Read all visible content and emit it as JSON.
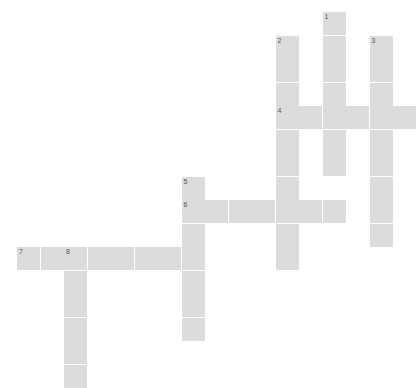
{
  "puzzle": {
    "title": "Crossword Puzzle Grid",
    "type": "crossword-grid",
    "columns": 17,
    "rows": 15,
    "cell_size_px": 23,
    "cell_pitch_px": 23.5,
    "origin_x_px": 17,
    "origin_y_px": 12,
    "cell_color": "#dcdcdc",
    "background_color": "#ffffff",
    "number_color": "#555555",
    "total_cells": 55,
    "numbered_clue_count": 8
  },
  "numbers": {
    "n1": "1",
    "n2": "2",
    "n3": "3",
    "n4": "4",
    "n5": "5",
    "n6": "6",
    "n7": "7",
    "n8": "8"
  },
  "entries": [
    {
      "number": "1",
      "direction": "down",
      "start_col": 13,
      "start_row": 0,
      "length": 6
    },
    {
      "number": "2",
      "direction": "down",
      "start_col": 11,
      "start_row": 1,
      "length": 10
    },
    {
      "number": "3",
      "direction": "down",
      "start_col": 15,
      "start_row": 1,
      "length": 9
    },
    {
      "number": "4",
      "direction": "across",
      "start_col": 11,
      "start_row": 4,
      "length": 6
    },
    {
      "number": "5",
      "direction": "down",
      "start_col": 7,
      "start_row": 7,
      "length": 7
    },
    {
      "number": "6",
      "direction": "across",
      "start_col": 7,
      "start_row": 8,
      "length": 7
    },
    {
      "number": "7",
      "direction": "across",
      "start_col": 0,
      "start_row": 10,
      "length": 8
    },
    {
      "number": "8",
      "direction": "down",
      "start_col": 2,
      "start_row": 10,
      "length": 6
    }
  ],
  "cells": [
    {
      "col": 13,
      "row": 0,
      "number": "1"
    },
    {
      "col": 11,
      "row": 1,
      "number": "2"
    },
    {
      "col": 13,
      "row": 1,
      "number": null
    },
    {
      "col": 15,
      "row": 1,
      "number": "3"
    },
    {
      "col": 11,
      "row": 2,
      "number": null
    },
    {
      "col": 13,
      "row": 2,
      "number": null
    },
    {
      "col": 15,
      "row": 2,
      "number": null
    },
    {
      "col": 11,
      "row": 3,
      "number": null
    },
    {
      "col": 13,
      "row": 3,
      "number": null
    },
    {
      "col": 15,
      "row": 3,
      "number": null
    },
    {
      "col": 11,
      "row": 4,
      "number": "4"
    },
    {
      "col": 12,
      "row": 4,
      "number": null
    },
    {
      "col": 13,
      "row": 4,
      "number": null
    },
    {
      "col": 14,
      "row": 4,
      "number": null
    },
    {
      "col": 15,
      "row": 4,
      "number": null
    },
    {
      "col": 16,
      "row": 4,
      "number": null
    },
    {
      "col": 11,
      "row": 5,
      "number": null
    },
    {
      "col": 13,
      "row": 5,
      "number": null
    },
    {
      "col": 15,
      "row": 5,
      "number": null
    },
    {
      "col": 11,
      "row": 6,
      "number": null
    },
    {
      "col": 13,
      "row": 6,
      "number": null
    },
    {
      "col": 15,
      "row": 6,
      "number": null
    },
    {
      "col": 7,
      "row": 7,
      "number": "5"
    },
    {
      "col": 11,
      "row": 7,
      "number": null
    },
    {
      "col": 15,
      "row": 7,
      "number": null
    },
    {
      "col": 11,
      "row": 8,
      "number": null
    },
    {
      "col": 15,
      "row": 8,
      "number": null
    },
    {
      "col": 7,
      "row": 8,
      "number": "6"
    },
    {
      "col": 8,
      "row": 8,
      "number": null
    },
    {
      "col": 9,
      "row": 8,
      "number": null
    },
    {
      "col": 10,
      "row": 8,
      "number": null
    },
    {
      "col": 12,
      "row": 8,
      "number": null
    },
    {
      "col": 13,
      "row": 8,
      "number": null
    },
    {
      "col": 7,
      "row": 9,
      "number": null
    },
    {
      "col": 11,
      "row": 9,
      "number": null
    },
    {
      "col": 15,
      "row": 9,
      "number": null
    },
    {
      "col": 0,
      "row": 10,
      "number": "7"
    },
    {
      "col": 1,
      "row": 10,
      "number": null
    },
    {
      "col": 2,
      "row": 10,
      "number": "8"
    },
    {
      "col": 3,
      "row": 10,
      "number": null
    },
    {
      "col": 4,
      "row": 10,
      "number": null
    },
    {
      "col": 5,
      "row": 10,
      "number": null
    },
    {
      "col": 6,
      "row": 10,
      "number": null
    },
    {
      "col": 7,
      "row": 10,
      "number": null
    },
    {
      "col": 11,
      "row": 10,
      "number": null
    },
    {
      "col": 2,
      "row": 11,
      "number": null
    },
    {
      "col": 7,
      "row": 11,
      "number": null
    },
    {
      "col": 2,
      "row": 12,
      "number": null
    },
    {
      "col": 7,
      "row": 12,
      "number": null
    },
    {
      "col": 2,
      "row": 13,
      "number": null
    },
    {
      "col": 7,
      "row": 13,
      "number": null
    },
    {
      "col": 2,
      "row": 14,
      "number": null
    },
    {
      "col": 2,
      "row": 15,
      "number": null
    }
  ]
}
